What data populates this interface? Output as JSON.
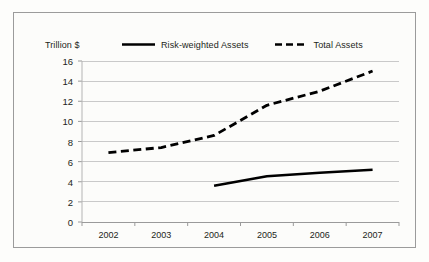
{
  "chart_data": {
    "type": "line",
    "title": "",
    "xlabel": "",
    "ylabel": "Trillion $",
    "categories": [
      "2002",
      "2003",
      "2004",
      "2005",
      "2006",
      "2007"
    ],
    "ylim": [
      0,
      16
    ],
    "ytick_values": [
      0,
      2,
      4,
      6,
      8,
      10,
      12,
      14,
      16
    ],
    "ytick_labels": [
      "0",
      "2",
      "4",
      "6",
      "8",
      "10",
      "12",
      "14",
      "16"
    ],
    "grid": true,
    "legend_position": "top",
    "series": [
      {
        "name": "Risk-weighted Assets",
        "style": "solid",
        "color": "#000000",
        "values": [
          null,
          null,
          3.6,
          4.55,
          4.9,
          5.2
        ]
      },
      {
        "name": "Total Assets",
        "style": "dashed",
        "color": "#000000",
        "values": [
          6.9,
          7.4,
          8.6,
          11.6,
          13.0,
          15.0
        ]
      }
    ]
  },
  "legend": {
    "items": [
      {
        "label": "Risk-weighted Assets",
        "swatch": "solid-line-swatch"
      },
      {
        "label": "Total Assets",
        "swatch": "dashed-line-swatch"
      }
    ]
  }
}
